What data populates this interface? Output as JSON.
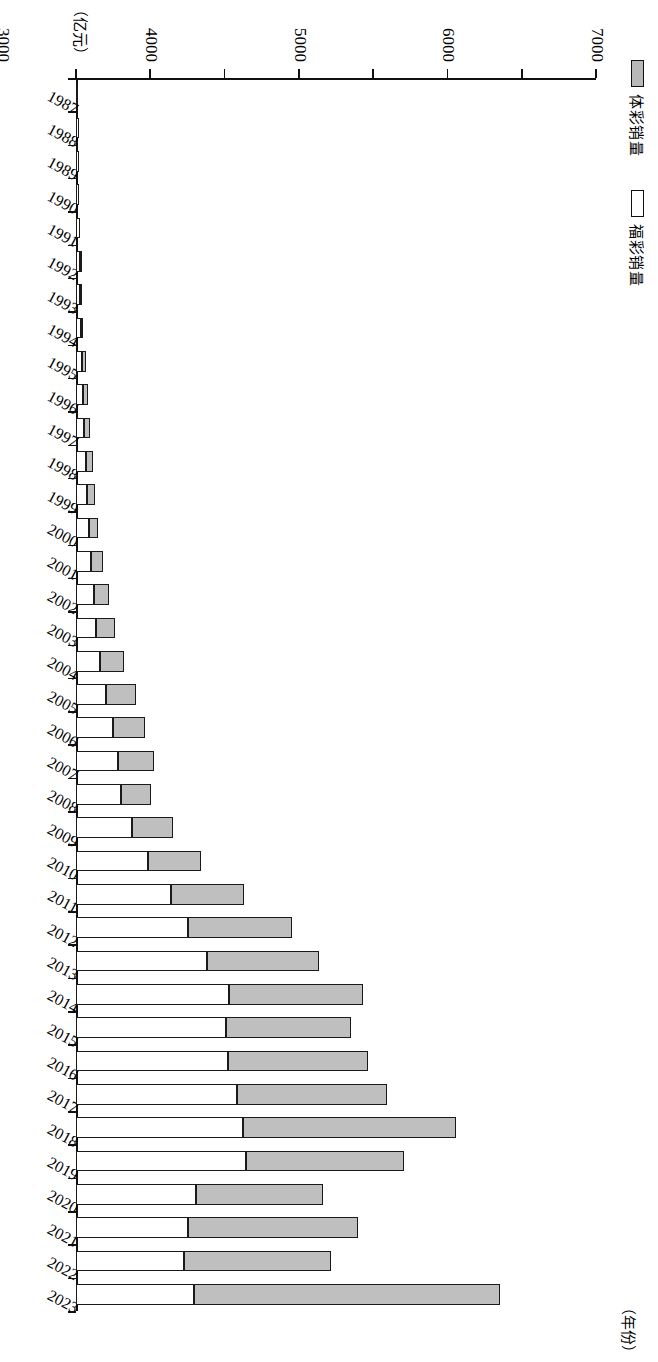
{
  "legend": {
    "entries": [
      {
        "label": "体彩销量",
        "color": "#bfbfbf",
        "key": "ticai"
      },
      {
        "label": "福彩销量",
        "color": "#ffffff",
        "key": "fucai"
      }
    ]
  },
  "axis": {
    "value_unit": "（亿元）",
    "category_unit": "（年份）",
    "value_ticks": [
      "0",
      "1000",
      "2000",
      "3000",
      "4000",
      "5000",
      "6000",
      "7000"
    ]
  },
  "chart_data": {
    "type": "bar",
    "orientation": "vertical-stacked",
    "title": "",
    "xlabel": "（年份）",
    "ylabel": "（亿元）",
    "ylim": [
      0,
      7000
    ],
    "grid": false,
    "legend_position": "top-left",
    "categories": [
      "1987",
      "1988",
      "1989",
      "1990",
      "1991",
      "1992",
      "1993",
      "1994",
      "1995",
      "1996",
      "1997",
      "1998",
      "1999",
      "2000",
      "2001",
      "2002",
      "2003",
      "2004",
      "2005",
      "2006",
      "2007",
      "2008",
      "2009",
      "2010",
      "2011",
      "2012",
      "2013",
      "2014",
      "2015",
      "2016",
      "2017",
      "2018",
      "2019",
      "2020",
      "2021",
      "2022",
      "2023"
    ],
    "series": [
      {
        "name": "福彩销量",
        "color": "#ffffff",
        "values": [
          17,
          37,
          40,
          45,
          50,
          55,
          60,
          70,
          85,
          100,
          110,
          130,
          150,
          170,
          200,
          240,
          270,
          320,
          410,
          500,
          560,
          610,
          760,
          970,
          1278,
          1510,
          1765,
          2059,
          2015,
          2047,
          2169,
          2250,
          2291,
          1613,
          1510,
          1450,
          1595
        ]
      },
      {
        "name": "体彩销量",
        "color": "#bfbfbf",
        "values": [
          0,
          0,
          0,
          0,
          0,
          10,
          20,
          30,
          45,
          60,
          75,
          95,
          110,
          130,
          160,
          200,
          260,
          320,
          400,
          430,
          490,
          400,
          550,
          710,
          980,
          1400,
          1510,
          1810,
          1690,
          1884,
          2020,
          2870,
          2126,
          1713,
          2292,
          1982,
          4110
        ]
      }
    ],
    "totals": [
      17,
      37,
      40,
      45,
      50,
      65,
      80,
      100,
      130,
      160,
      185,
      225,
      260,
      300,
      360,
      440,
      530,
      640,
      810,
      930,
      1050,
      1010,
      1310,
      1680,
      2258,
      2910,
      3275,
      3869,
      3705,
      3931,
      4189,
      5120,
      4417,
      3326,
      3802,
      3432,
      5705
    ]
  }
}
